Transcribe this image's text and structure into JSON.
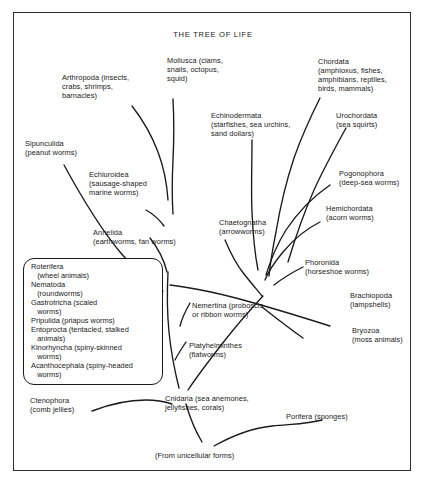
{
  "diagram": {
    "title": "THE TREE OF LIFE",
    "root_label": "(From unicellular forms)",
    "uncertainty_marker": "?"
  },
  "labels": {
    "arthropoda": "Arthropoda (insects,\ncrabs, shrimps,\nbarnacles)",
    "mollusca": "Mollusca (clams,\nsnails, octopus,\nsquid)",
    "chordata": "Chordata\n(amphioxus, fishes,\namphibians, reptiles,\nbirds, mammals)",
    "echinodermata": "Echinodermata\n(starfishes, sea urchins,\nsand dollars)",
    "urochordata": "Urochordata\n(sea squirts)",
    "sipunculida": "Sipunculida\n(peanut worms)",
    "echiuroidea": "Echiuroidea\n(sausage-shaped\nmarine worms)",
    "pogonophora": "Pogonophora\n(deep-sea worms)",
    "hemichordata": "Hemichordata\n(acorn worms)",
    "chaetognatha": "Chaetognatha\n(arrowworms)",
    "annelida": "Annelida\n(earthworms, fan worms)",
    "phoronida": "Phoronida\n(horseshoe worms)",
    "nemertina": "Nemertina (proboscis\nor ribbon worms)",
    "brachiopoda": "Brachiopoda\n(lampshells)",
    "bryozoa": "Bryozoa\n(moss animals)",
    "platyhelminthes": "Platyhelminthes\n(flatworms)",
    "ctenophora": "Ctenophora\n(comb jellies)",
    "cnidaria": "Cnidaria (sea anemones,\njellyfishes, corals)",
    "porifera": "Porifera (sponges)"
  },
  "pseudocoelomate_box": {
    "items": [
      "Roterifera",
      "   (wheel animals)",
      "Nematoda",
      "   (roundworms)",
      "Gastrotricha (scaled",
      "   worms)",
      "Pripulida (priapus worms)",
      "Entoprocta (tentacled, stalked",
      "   animals)",
      "Kinorhyncha (spiny-skinned",
      "   worms)",
      "Acanthocephala (spiny-headed",
      "   worms)"
    ]
  },
  "colors": {
    "ink": "#1a1a1a",
    "frame": "#2b2b2b",
    "background": "#ffffff"
  }
}
